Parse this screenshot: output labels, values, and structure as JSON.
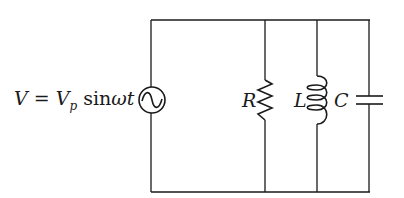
{
  "diagram": {
    "type": "parallel RLC circuit",
    "source": {
      "label_lhs": "V",
      "equals": "=",
      "label_v": "V",
      "label_sub": "p",
      "label_func": "sin",
      "label_omega_t": "ωt",
      "symbol": "ac-voltage-source"
    },
    "components": [
      {
        "id": "resistor",
        "label": "R",
        "symbol": "resistor-zigzag"
      },
      {
        "id": "inductor",
        "label": "L",
        "symbol": "inductor-coil"
      },
      {
        "id": "capacitor",
        "label": "C",
        "symbol": "capacitor-plates"
      }
    ],
    "colors": {
      "line": "#1a1a1a",
      "background": "#ffffff"
    }
  }
}
